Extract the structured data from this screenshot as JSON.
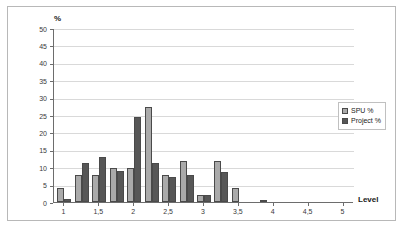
{
  "chart_data": {
    "type": "bar",
    "title": "",
    "xlabel": "Level",
    "ylabel": "%",
    "ylim": [
      0,
      50
    ],
    "ytick_values": [
      0,
      5,
      10,
      15,
      20,
      25,
      30,
      35,
      40,
      45,
      50
    ],
    "ytick_labels": [
      "0",
      "5",
      "10",
      "15",
      "20",
      "25",
      "30",
      "35",
      "40",
      "45",
      "50"
    ],
    "xlim": [
      0.85,
      5.15
    ],
    "xtick_values": [
      1,
      1.5,
      2,
      2.5,
      3,
      3.5,
      4,
      4.5,
      5
    ],
    "xtick_labels": [
      "1",
      "1,5",
      "2",
      "2,5",
      "3",
      "3,5",
      "4",
      "4,5",
      "5"
    ],
    "grid": true,
    "legend_position": "right",
    "categories": [
      1.0,
      1.25,
      1.5,
      1.75,
      2.0,
      2.25,
      2.5,
      2.75,
      3.0,
      3.25,
      3.5,
      3.8
    ],
    "series": [
      {
        "name": "SPU %",
        "color": "#aaaaaa",
        "values": [
          4.0,
          7.7,
          7.7,
          9.8,
          9.8,
          27.3,
          7.7,
          11.7,
          1.9,
          11.7,
          4.0,
          0.0
        ]
      },
      {
        "name": "Project %",
        "color": "#575757",
        "values": [
          1.0,
          11.3,
          12.8,
          8.8,
          24.5,
          11.3,
          7.1,
          7.7,
          2.0,
          8.7,
          0.0,
          0.5
        ]
      }
    ]
  },
  "legend": {
    "items": [
      {
        "label": "SPU %",
        "key": "spu"
      },
      {
        "label": "Project %",
        "key": "project"
      }
    ]
  },
  "axes": {
    "y_title": "%",
    "x_title": "Level"
  }
}
